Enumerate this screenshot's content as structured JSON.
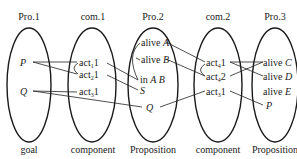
{
  "columns": [
    {
      "id": "pro1",
      "title": "Pro.1",
      "caption": "goal",
      "cx": 29
    },
    {
      "id": "com1",
      "title": "com.1",
      "caption": "component",
      "cx": 93
    },
    {
      "id": "pro2",
      "title": "Pro.2",
      "caption": "Proposition",
      "cx": 153
    },
    {
      "id": "com2",
      "title": "com.2",
      "caption": "component",
      "cx": 218
    },
    {
      "id": "pro3",
      "title": "Pro.3",
      "caption": "Proposition",
      "cx": 275
    }
  ],
  "nodes": {
    "pro1": [
      {
        "label": "P"
      },
      {
        "label": "Q"
      }
    ],
    "com1": [
      {
        "base": "act",
        "sub": "1",
        "tail": "1"
      },
      {
        "base": "act",
        "sub": "2",
        "tail": "1"
      },
      {
        "base": "act",
        "sub": "3",
        "tail": "1"
      }
    ],
    "pro2": [
      {
        "pre": "alive ",
        "var": "A"
      },
      {
        "pre": "alive ",
        "var": "B"
      },
      {
        "pre": "in ",
        "var": "A B"
      },
      {
        "pre": "",
        "var": "S"
      },
      {
        "pre": "",
        "var": "Q"
      }
    ],
    "com2": [
      {
        "base": "act",
        "sub": "4",
        "tail": "1"
      },
      {
        "base": "act",
        "sub": "4",
        "tail": "2"
      },
      {
        "base": "act",
        "sub": "3",
        "tail": "1"
      }
    ],
    "pro3": [
      {
        "pre": "alive ",
        "var": "C"
      },
      {
        "pre": "alive ",
        "var": "D"
      },
      {
        "pre": "alive ",
        "var": "E"
      },
      {
        "pre": "",
        "var": "P"
      }
    ]
  },
  "edges": [
    "P-act1_1",
    "P-act2_1",
    "Q-act3_1",
    "Q-Q(pro2)",
    "act1_1-inAB",
    "act2_1-S",
    "aliveA-act4_1",
    "aliveB-act4_2",
    "act4_1-aliveD",
    "act4_2-aliveC",
    "act4_1-aliveC",
    "act3_1(com2)-Q(pro2)",
    "act3_1(com2)-P(pro3)"
  ]
}
